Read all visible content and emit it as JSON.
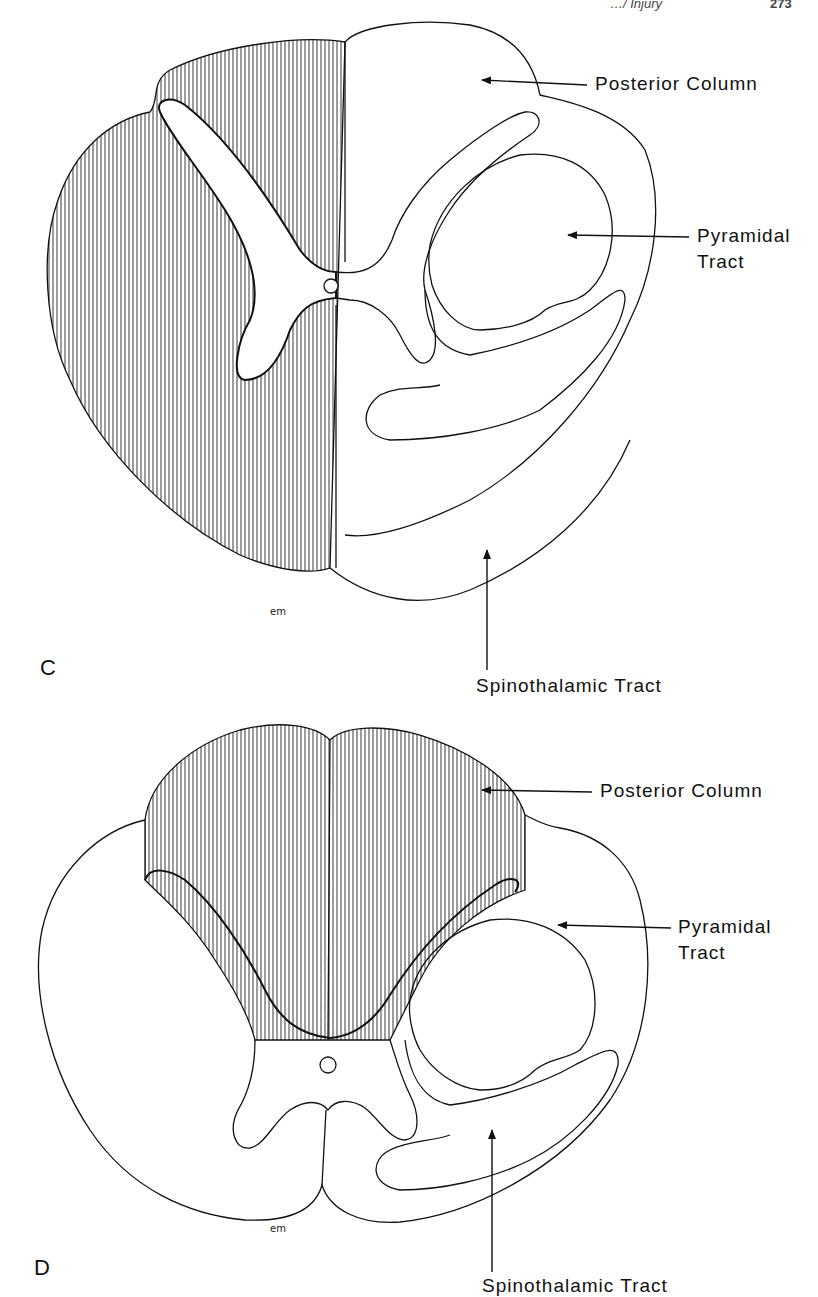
{
  "page_header": {
    "running_title": "…/ Injury",
    "page_number": "273"
  },
  "figures": [
    {
      "panel_label": "C",
      "signature": "em",
      "shaded_region": "left half of cord (posterior column, lateral and anterior funiculi)",
      "labels": {
        "posterior_column": "Posterior Column",
        "pyramidal_line1": "Pyramidal",
        "pyramidal_line2": "Tract",
        "spinothalamic": "Spinothalamic Tract"
      }
    },
    {
      "panel_label": "D",
      "signature": "em",
      "shaded_region": "bilateral posterior columns",
      "labels": {
        "posterior_column": "Posterior Column",
        "pyramidal_line1": "Pyramidal",
        "pyramidal_line2": "Tract",
        "spinothalamic": "Spinothalamic Tract"
      }
    }
  ],
  "colors": {
    "ink": "#111111",
    "background": "#ffffff"
  }
}
